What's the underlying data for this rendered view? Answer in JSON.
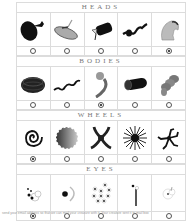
{
  "sections": [
    {
      "title": "HEADS",
      "items": [
        {
          "icon": "head-blob-icon",
          "selected": false
        },
        {
          "icon": "head-capsule-icon",
          "selected": false
        },
        {
          "icon": "head-cylinder-icon",
          "selected": false
        },
        {
          "icon": "head-squiggle-icon",
          "selected": false
        },
        {
          "icon": "head-hood-icon",
          "selected": true
        }
      ]
    },
    {
      "title": "BODIES",
      "items": [
        {
          "icon": "body-coil-icon",
          "selected": false
        },
        {
          "icon": "body-wave-icon",
          "selected": false
        },
        {
          "icon": "body-hook-icon",
          "selected": true
        },
        {
          "icon": "body-tube-icon",
          "selected": false
        },
        {
          "icon": "body-segments-icon",
          "selected": false
        }
      ]
    },
    {
      "title": "WHEELS",
      "items": [
        {
          "icon": "wheel-spiral-icon",
          "selected": true
        },
        {
          "icon": "wheel-gear-icon",
          "selected": false
        },
        {
          "icon": "wheel-triskelion-icon",
          "selected": false
        },
        {
          "icon": "wheel-star-icon",
          "selected": false
        },
        {
          "icon": "wheel-legs-icon",
          "selected": false
        }
      ]
    },
    {
      "title": "EYES",
      "items": [
        {
          "icon": "eyes-cluster-icon",
          "selected": true
        },
        {
          "icon": "eyes-single-icon",
          "selected": false
        },
        {
          "icon": "eyes-many-icon",
          "selected": false
        },
        {
          "icon": "eyes-stalk-icon",
          "selected": false
        },
        {
          "icon": "eyes-faint-icon",
          "selected": false
        }
      ]
    }
  ],
  "footer": {
    "text": "send your email address so that we can mail your creature with it. Your creature sent it to mail box"
  }
}
